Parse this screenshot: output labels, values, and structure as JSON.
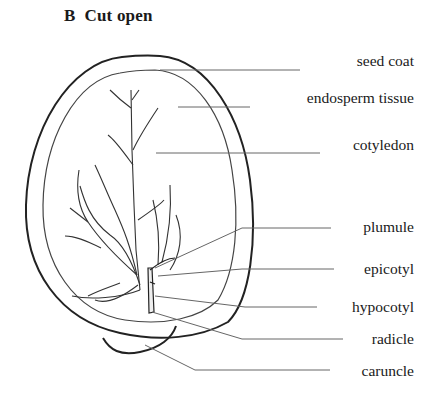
{
  "figure": {
    "panel_letter": "B",
    "title": "Cut open",
    "title_full": "B  Cut open"
  },
  "labels": [
    {
      "id": "seed-coat",
      "text": "seed coat",
      "y": 61
    },
    {
      "id": "endosperm-tissue",
      "text": "endosperm tissue",
      "y": 98
    },
    {
      "id": "cotyledon",
      "text": "cotyledon",
      "y": 145
    },
    {
      "id": "plumule",
      "text": "plumule",
      "y": 227
    },
    {
      "id": "epicotyl",
      "text": "epicotyl",
      "y": 269
    },
    {
      "id": "hypocotyl",
      "text": "hypocotyl",
      "y": 307
    },
    {
      "id": "radicle",
      "text": "radicle",
      "y": 339
    },
    {
      "id": "caruncle",
      "text": "caruncle",
      "y": 371
    }
  ],
  "colors": {
    "outline": "#222222",
    "leader_line": "#555555",
    "text": "#1a1a1a",
    "background": "#ffffff"
  }
}
